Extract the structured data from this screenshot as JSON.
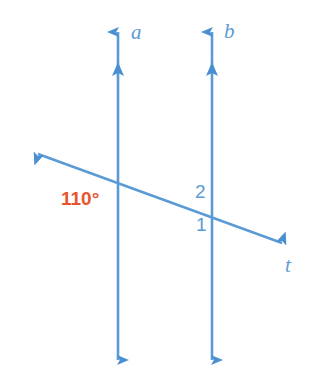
{
  "figure": {
    "kind": "geometry-diagram",
    "background_color": "#ffffff",
    "line_color": "#5B9BD5",
    "angle_measure_color": "#E8552D",
    "label_color": "#5B9BD5"
  },
  "lines": [
    {
      "id": "line-a",
      "label": "a",
      "orientation": "vertical",
      "x": 118,
      "y_top": 20,
      "y_bottom": 372,
      "arrow_top": true,
      "arrow_bottom": true,
      "second_arrow_y": 72,
      "label_x": 131,
      "label_y": 23
    },
    {
      "id": "line-b",
      "label": "b",
      "orientation": "vertical",
      "x": 212,
      "y_top": 20,
      "y_bottom": 372,
      "arrow_top": true,
      "arrow_bottom": true,
      "second_arrow_y": 72,
      "label_x": 224,
      "label_y": 22
    },
    {
      "id": "line-t",
      "label": "t",
      "orientation": "transversal",
      "x1": 27,
      "y1": 150,
      "x2": 293,
      "y2": 247,
      "arrow_start": true,
      "arrow_end": true,
      "label_x": 284,
      "label_y": 255
    }
  ],
  "intersections": [
    {
      "id": "intersection-a-t",
      "x": 118,
      "y": 182
    },
    {
      "id": "intersection-b-t",
      "x": 212,
      "y": 212
    }
  ],
  "angle_labels": [
    {
      "id": "angle-110",
      "text": "110°",
      "value": 110,
      "unit": "degrees",
      "color": "#E8552D",
      "x": 61,
      "y": 188,
      "at_intersection": "intersection-a-t",
      "position": "lower-left"
    },
    {
      "id": "angle-2",
      "text": "2",
      "color": "#5B9BD5",
      "x": 195,
      "y": 182,
      "at_intersection": "intersection-b-t",
      "position": "upper-left"
    },
    {
      "id": "angle-1",
      "text": "1",
      "color": "#5B9BD5",
      "x": 196,
      "y": 215,
      "at_intersection": "intersection-b-t",
      "position": "lower-left"
    }
  ]
}
